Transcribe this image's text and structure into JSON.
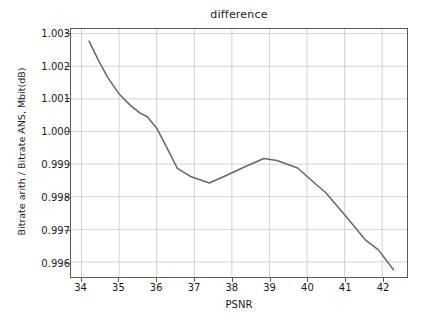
{
  "chart_data": {
    "type": "line",
    "title": "difference",
    "xlabel": "PSNR",
    "ylabel": "Bitrate arith / Bitrate ANS, Mbit(dB)",
    "grid": true,
    "legend": null,
    "legend_position": "none",
    "line_color": "#666666",
    "background_color": "#ffffff",
    "grid_color": "#c8c8c8",
    "axis_color": "#5a5a5a",
    "xlim": [
      33.72,
      42.66
    ],
    "ylim": [
      0.99554,
      1.00314
    ],
    "xticks": [
      34,
      35,
      36,
      37,
      38,
      39,
      40,
      41,
      42
    ],
    "xtick_labels": [
      "34",
      "35",
      "36",
      "37",
      "38",
      "39",
      "40",
      "41",
      "42"
    ],
    "yticks": [
      0.996,
      0.997,
      0.998,
      0.999,
      1.0,
      1.001,
      1.002,
      1.003
    ],
    "ytick_labels": [
      "0.996",
      "0.997",
      "0.998",
      "0.999",
      "1.000",
      "1.001",
      "1.002",
      "1.003"
    ],
    "series": [
      {
        "name": "difference",
        "color": "#666666",
        "x": [
          34.2,
          34.45,
          34.7,
          35.0,
          35.3,
          35.55,
          35.75,
          36.0,
          36.25,
          36.55,
          36.9,
          37.4,
          37.85,
          38.35,
          38.85,
          39.2,
          39.75,
          40.1,
          40.5,
          41.0,
          41.55,
          41.9,
          42.3
        ],
        "y": [
          1.00277,
          1.00218,
          1.00165,
          1.00115,
          1.0008,
          1.00057,
          1.00045,
          1.0001,
          0.99955,
          0.99887,
          0.99862,
          0.99842,
          0.99865,
          0.99892,
          0.99917,
          0.99911,
          0.99888,
          0.99852,
          0.99812,
          0.99745,
          0.99668,
          0.99637,
          0.99576
        ]
      }
    ]
  }
}
